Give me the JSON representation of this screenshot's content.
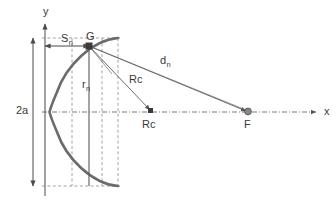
{
  "figure": {
    "background_color": "#ffffff",
    "curve_color": "#6b6b6b",
    "line_color": "#555555",
    "axis_color": "#666666",
    "text_color": "#3a3a3a",
    "width": 336,
    "height": 209
  },
  "axes": {
    "y_label": "y",
    "x_label": "x",
    "y_axis": {
      "x": 45,
      "y_top": 22,
      "y_bottom": 196
    },
    "x_axis": {
      "y": 112,
      "x_left": 42,
      "x_right": 318
    }
  },
  "labels": {
    "sagitta": {
      "base": "S",
      "sub": "n",
      "x": 62,
      "y": 33
    },
    "vertex_point": {
      "base": "G",
      "sub": "",
      "x": 89,
      "y": 32
    },
    "radius": {
      "base": "r",
      "sub": "n",
      "x": 83,
      "y": 82
    },
    "slant_distance": {
      "base": "d",
      "sub": "n",
      "x": 161,
      "y": 57
    },
    "curvature_upper": {
      "base": "Rc",
      "sub": "",
      "x": 130,
      "y": 75
    },
    "curvature_lower": {
      "base": "Rc",
      "sub": "",
      "x": 143,
      "y": 119
    },
    "focus": {
      "base": "F",
      "sub": "",
      "x": 245,
      "y": 119
    },
    "aperture": {
      "base": "2a",
      "sub": "",
      "x": 18,
      "y": 104
    }
  },
  "points": {
    "G": {
      "x": 89,
      "y": 46
    },
    "F": {
      "x": 248,
      "y": 112
    },
    "Rc_center": {
      "x": 151,
      "y": 111
    },
    "vertex": {
      "x": 45,
      "y": 112
    }
  },
  "geometry": {
    "aperture_arrow": {
      "x": 33,
      "y_top": 38,
      "y_bottom": 186
    },
    "sagitta_arrow": {
      "y": 38,
      "x_left": 45,
      "x_right": 89
    },
    "dashed_verticals_x": [
      72,
      89,
      102,
      118
    ],
    "dashed_horizontals_y": [
      38,
      186
    ],
    "parabola": {
      "vertex_x": 45,
      "vertex_y": 112,
      "half_height": 74,
      "end_x": 118
    }
  }
}
